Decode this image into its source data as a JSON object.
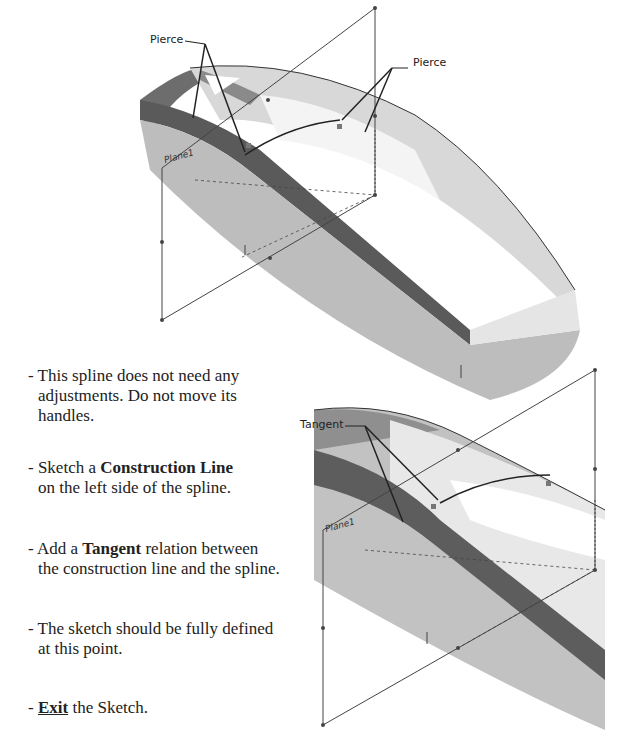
{
  "figure_top": {
    "callouts": [
      {
        "label": "Pierce",
        "id": "pierce-left"
      },
      {
        "label": "Pierce",
        "id": "pierce-right"
      }
    ],
    "plane_label": "Plane1"
  },
  "figure_bottom": {
    "callouts": [
      {
        "label": "Tangent",
        "id": "tangent"
      }
    ],
    "plane_label": "Plane1"
  },
  "steps": [
    {
      "line1": "- This spline does not need any",
      "line2": "adjustments. Do not move its",
      "line3": "handles."
    },
    {
      "prefix": "- Sketch a ",
      "bold": "Construction Line",
      "line2": "on the left side of the spline."
    },
    {
      "prefix": "- Add a ",
      "bold": "Tangent",
      "suffix": " relation between",
      "line2": "the construction line and the spline."
    },
    {
      "line1": "- The sketch should be fully defined",
      "line2": "at this point."
    },
    {
      "prefix": "- ",
      "bold": "Exit",
      "suffix": " the Sketch."
    }
  ]
}
